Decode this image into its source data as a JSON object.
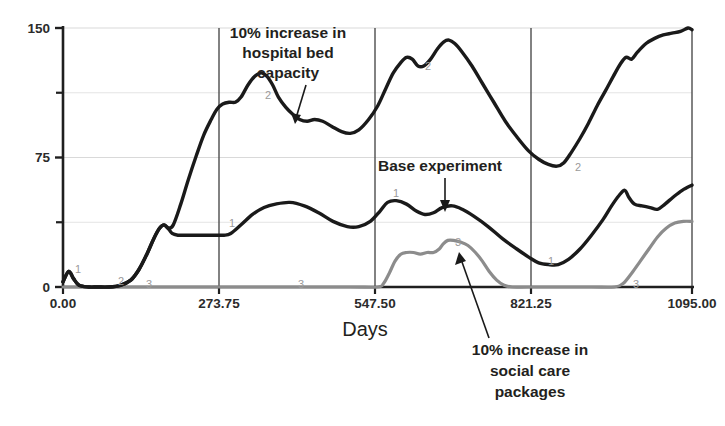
{
  "chart_data": {
    "type": "line",
    "title": "",
    "xlabel": "Days",
    "ylabel": "",
    "xlim": [
      0,
      1095
    ],
    "ylim": [
      0,
      150
    ],
    "grid": true,
    "legend_position": "none",
    "xticks": [
      "0.00",
      "273.75",
      "547.50",
      "821.25",
      "1095.00"
    ],
    "xtick_values": [
      0,
      273.75,
      547.5,
      821.25,
      1095
    ],
    "yticks": [
      "0",
      "75",
      "150"
    ],
    "ytick_values": [
      0,
      75,
      150
    ],
    "minor_ytick_values": [
      37.5,
      112.5
    ],
    "series": [
      {
        "name": "1",
        "label": "Base experiment",
        "color": "#1a1a1a",
        "marker_label": "1",
        "points": [
          [
            0,
            3
          ],
          [
            10,
            9
          ],
          [
            18,
            5
          ],
          [
            28,
            1
          ],
          [
            45,
            0
          ],
          [
            60,
            0
          ],
          [
            80,
            0
          ],
          [
            100,
            1
          ],
          [
            118,
            4
          ],
          [
            132,
            10
          ],
          [
            146,
            19
          ],
          [
            158,
            28
          ],
          [
            168,
            34
          ],
          [
            176,
            36
          ],
          [
            183,
            34
          ],
          [
            190,
            31
          ],
          [
            200,
            30
          ],
          [
            215,
            30
          ],
          [
            240,
            30
          ],
          [
            265,
            30
          ],
          [
            280,
            30
          ],
          [
            292,
            31
          ],
          [
            310,
            36
          ],
          [
            330,
            42
          ],
          [
            350,
            46
          ],
          [
            370,
            48
          ],
          [
            395,
            49
          ],
          [
            420,
            47
          ],
          [
            445,
            43
          ],
          [
            470,
            38
          ],
          [
            495,
            35
          ],
          [
            515,
            35
          ],
          [
            535,
            38
          ],
          [
            552,
            44
          ],
          [
            565,
            49
          ],
          [
            580,
            50
          ],
          [
            598,
            48
          ],
          [
            615,
            44
          ],
          [
            630,
            42
          ],
          [
            645,
            43
          ],
          [
            660,
            46
          ],
          [
            678,
            47
          ],
          [
            695,
            45
          ],
          [
            715,
            41
          ],
          [
            740,
            35
          ],
          [
            765,
            28
          ],
          [
            790,
            22
          ],
          [
            812,
            17
          ],
          [
            828,
            14
          ],
          [
            845,
            13
          ],
          [
            862,
            13
          ],
          [
            880,
            16
          ],
          [
            900,
            22
          ],
          [
            920,
            30
          ],
          [
            940,
            39
          ],
          [
            955,
            47
          ],
          [
            968,
            53
          ],
          [
            978,
            56
          ],
          [
            985,
            52
          ],
          [
            995,
            48
          ],
          [
            1008,
            47
          ],
          [
            1022,
            46
          ],
          [
            1035,
            45
          ],
          [
            1048,
            48
          ],
          [
            1062,
            52
          ],
          [
            1078,
            56
          ],
          [
            1095,
            59
          ]
        ]
      },
      {
        "name": "2",
        "label": "10% increase in hospital bed capacity",
        "color": "#1a1a1a",
        "marker_label": "2",
        "points": [
          [
            0,
            3
          ],
          [
            10,
            9
          ],
          [
            18,
            5
          ],
          [
            28,
            1
          ],
          [
            45,
            0
          ],
          [
            60,
            0
          ],
          [
            80,
            0
          ],
          [
            100,
            1
          ],
          [
            118,
            4
          ],
          [
            132,
            10
          ],
          [
            146,
            19
          ],
          [
            158,
            28
          ],
          [
            168,
            34
          ],
          [
            176,
            36
          ],
          [
            183,
            34
          ],
          [
            192,
            36
          ],
          [
            205,
            48
          ],
          [
            218,
            62
          ],
          [
            232,
            76
          ],
          [
            245,
            88
          ],
          [
            258,
            97
          ],
          [
            268,
            103
          ],
          [
            278,
            106
          ],
          [
            290,
            107
          ],
          [
            300,
            107
          ],
          [
            310,
            110
          ],
          [
            322,
            117
          ],
          [
            334,
            122
          ],
          [
            345,
            124
          ],
          [
            355,
            122
          ],
          [
            365,
            117
          ],
          [
            375,
            110
          ],
          [
            388,
            104
          ],
          [
            400,
            100
          ],
          [
            412,
            97
          ],
          [
            425,
            96
          ],
          [
            438,
            97
          ],
          [
            452,
            96
          ],
          [
            468,
            93
          ],
          [
            485,
            90
          ],
          [
            500,
            89
          ],
          [
            515,
            91
          ],
          [
            532,
            97
          ],
          [
            548,
            105
          ],
          [
            562,
            115
          ],
          [
            575,
            124
          ],
          [
            588,
            130
          ],
          [
            598,
            133
          ],
          [
            608,
            132
          ],
          [
            618,
            128
          ],
          [
            628,
            128
          ],
          [
            640,
            132
          ],
          [
            652,
            138
          ],
          [
            663,
            142
          ],
          [
            672,
            143
          ],
          [
            682,
            141
          ],
          [
            695,
            136
          ],
          [
            712,
            128
          ],
          [
            730,
            118
          ],
          [
            750,
            107
          ],
          [
            770,
            96
          ],
          [
            790,
            87
          ],
          [
            810,
            79
          ],
          [
            828,
            74
          ],
          [
            845,
            71
          ],
          [
            860,
            70
          ],
          [
            872,
            72
          ],
          [
            885,
            78
          ],
          [
            900,
            86
          ],
          [
            915,
            95
          ],
          [
            930,
            105
          ],
          [
            945,
            114
          ],
          [
            958,
            122
          ],
          [
            970,
            129
          ],
          [
            980,
            133
          ],
          [
            990,
            132
          ],
          [
            1000,
            136
          ],
          [
            1015,
            141
          ],
          [
            1030,
            144
          ],
          [
            1045,
            146
          ],
          [
            1060,
            147
          ],
          [
            1075,
            148
          ],
          [
            1088,
            150
          ],
          [
            1095,
            149
          ]
        ]
      },
      {
        "name": "3",
        "label": "10% increase in social care packages",
        "color": "#8c8c8c",
        "marker_label": "3",
        "points": [
          [
            0,
            0
          ],
          [
            60,
            0
          ],
          [
            140,
            0
          ],
          [
            260,
            0
          ],
          [
            400,
            0
          ],
          [
            500,
            0
          ],
          [
            548,
            0
          ],
          [
            558,
            2
          ],
          [
            568,
            8
          ],
          [
            578,
            15
          ],
          [
            588,
            19
          ],
          [
            598,
            20
          ],
          [
            610,
            20
          ],
          [
            622,
            19
          ],
          [
            634,
            20
          ],
          [
            645,
            20
          ],
          [
            655,
            22
          ],
          [
            662,
            25
          ],
          [
            670,
            27
          ],
          [
            680,
            27
          ],
          [
            692,
            26
          ],
          [
            705,
            24
          ],
          [
            718,
            20
          ],
          [
            730,
            15
          ],
          [
            742,
            9
          ],
          [
            755,
            4
          ],
          [
            768,
            1
          ],
          [
            782,
            0
          ],
          [
            810,
            0
          ],
          [
            860,
            0
          ],
          [
            920,
            0
          ],
          [
            960,
            0
          ],
          [
            975,
            2
          ],
          [
            990,
            8
          ],
          [
            1005,
            15
          ],
          [
            1020,
            22
          ],
          [
            1035,
            29
          ],
          [
            1050,
            34
          ],
          [
            1065,
            37
          ],
          [
            1080,
            38
          ],
          [
            1095,
            38
          ]
        ]
      }
    ],
    "annotations": [
      {
        "id": "annot-hospital",
        "lines": [
          "10% increase in",
          "hospital bed",
          "capacity"
        ],
        "text": "10% increase in hospital bed capacity",
        "target_series": "2"
      },
      {
        "id": "annot-base",
        "lines": [
          "Base experiment"
        ],
        "text": "Base experiment",
        "target_series": "1"
      },
      {
        "id": "annot-social",
        "lines": [
          "10% increase in",
          "social care",
          "packages"
        ],
        "text": "10% increase in social care packages",
        "target_series": "3"
      }
    ],
    "series_point_labels": [
      {
        "label": "1",
        "x_px": 75,
        "y_px": 273
      },
      {
        "label": "2",
        "x_px": 118,
        "y_px": 285
      },
      {
        "label": "3",
        "x_px": 146,
        "y_px": 288
      },
      {
        "label": "3",
        "x_px": 298,
        "y_px": 288
      },
      {
        "label": "2",
        "x_px": 265,
        "y_px": 99
      },
      {
        "label": "1",
        "x_px": 229,
        "y_px": 227
      },
      {
        "label": "1",
        "x_px": 393,
        "y_px": 197
      },
      {
        "label": "2",
        "x_px": 425,
        "y_px": 70
      },
      {
        "label": "3",
        "x_px": 455,
        "y_px": 246
      },
      {
        "label": "1",
        "x_px": 548,
        "y_px": 265
      },
      {
        "label": "2",
        "x_px": 575,
        "y_px": 171
      },
      {
        "label": "3",
        "x_px": 633,
        "y_px": 288
      }
    ]
  },
  "axes": {
    "x_axis_label": "Days",
    "y_axis_label": ""
  }
}
